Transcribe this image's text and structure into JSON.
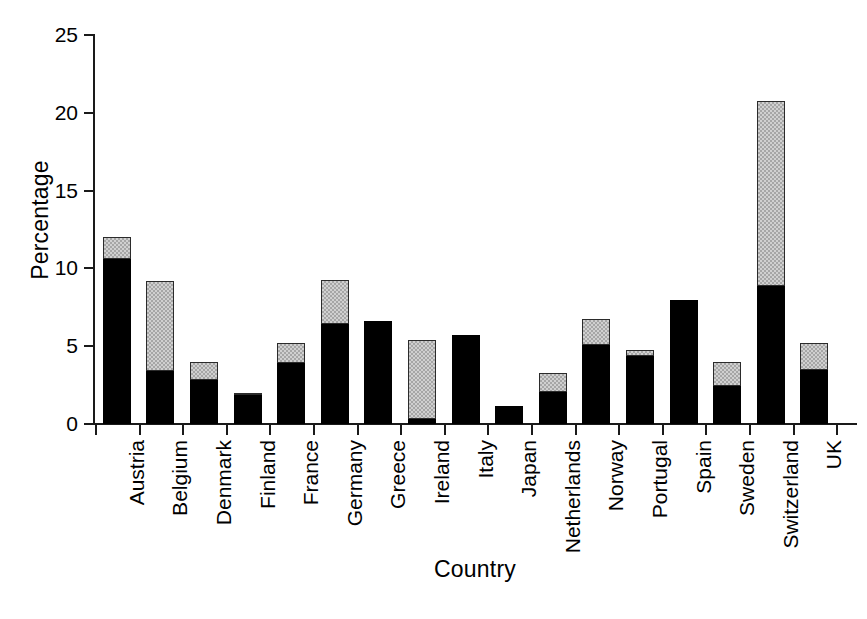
{
  "chart_data": {
    "type": "bar",
    "title": "",
    "subtitle": "",
    "xlabel": "Country",
    "ylabel": "Percentage",
    "stacked": true,
    "grid": false,
    "legend": "none",
    "ylim": [
      0,
      25
    ],
    "yticks": [
      0,
      5,
      10,
      15,
      20,
      25
    ],
    "ytick_labels": [
      "0",
      "5",
      "10",
      "15",
      "20",
      "25"
    ],
    "categories": [
      "Austria",
      "Belgium",
      "Denmark",
      "Finland",
      "France",
      "Germany",
      "Greece",
      "Ireland",
      "Italy",
      "Japan",
      "Netherlands",
      "Norway",
      "Portugal",
      "Spain",
      "Sweden",
      "Switzerland",
      "UK"
    ],
    "series": [
      {
        "name": "black-segment",
        "color": "#000000",
        "values": [
          10.6,
          3.4,
          2.85,
          1.85,
          3.9,
          6.4,
          6.6,
          0.3,
          5.7,
          1.15,
          2.05,
          5.05,
          4.4,
          8.0,
          2.45,
          8.85,
          3.5
        ]
      },
      {
        "name": "gray-segment",
        "color": "#c8c8c8",
        "values": [
          1.4,
          5.8,
          1.15,
          0.15,
          1.3,
          2.85,
          0.0,
          5.1,
          0.0,
          0.0,
          1.25,
          1.7,
          0.35,
          0.0,
          1.55,
          11.9,
          1.7
        ]
      }
    ],
    "totals": [
      12.0,
      9.2,
      4.0,
      2.0,
      5.2,
      9.25,
      6.6,
      5.4,
      5.7,
      1.15,
      3.3,
      6.75,
      4.75,
      8.0,
      4.0,
      20.75,
      5.2
    ]
  }
}
